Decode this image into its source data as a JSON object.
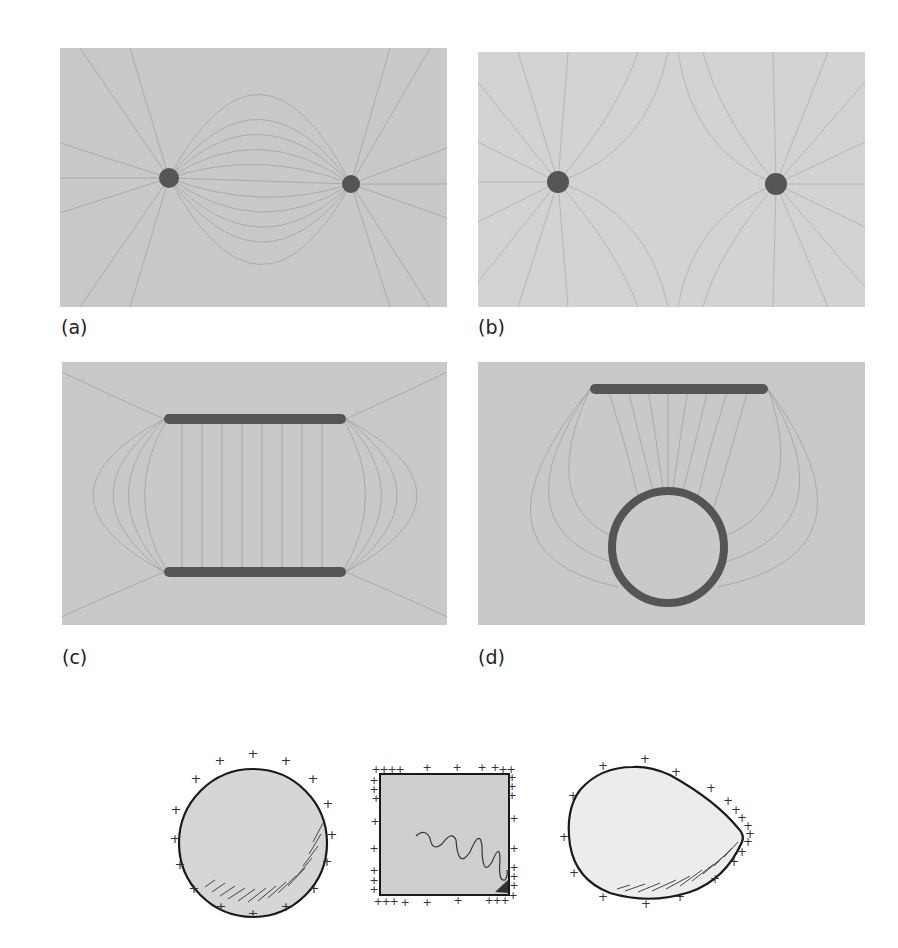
{
  "figure": {
    "panels": [
      {
        "id": "a",
        "label": "(a)",
        "description": "Field lines of two equal and opposite point charges (electric dipole)",
        "objects": [
          {
            "type": "point-charge",
            "cx": 109,
            "cy": 130
          },
          {
            "type": "point-charge",
            "cx": 291,
            "cy": 136
          }
        ]
      },
      {
        "id": "b",
        "label": "(b)",
        "description": "Field lines of two equal like point charges",
        "objects": [
          {
            "type": "point-charge",
            "cx": 80,
            "cy": 130
          },
          {
            "type": "point-charge",
            "cx": 298,
            "cy": 132
          }
        ]
      },
      {
        "id": "c",
        "label": "(c)",
        "description": "Field lines between two oppositely charged parallel plates",
        "objects": [
          {
            "type": "plate",
            "x1": 102,
            "x2": 284,
            "y": 57
          },
          {
            "type": "plate",
            "x1": 102,
            "x2": 284,
            "y": 210
          }
        ]
      },
      {
        "id": "d",
        "label": "(d)",
        "description": "Field lines between a charged plate and a charged ring",
        "objects": [
          {
            "type": "plate",
            "x1": 112,
            "x2": 290,
            "y": 27
          },
          {
            "type": "ring",
            "cx": 190,
            "cy": 185,
            "r": 58
          }
        ]
      }
    ],
    "conductors": [
      {
        "shape": "circle",
        "description": "Spherical conductor with uniform surface charge"
      },
      {
        "shape": "square",
        "description": "Square conductor with charge concentrated at corners"
      },
      {
        "shape": "teardrop",
        "description": "Pointed conductor with charge concentrated at the tip"
      }
    ],
    "charge_symbol": "+",
    "colors": {
      "panel_background": "#c9c9c9",
      "field_line": "#8c8c8c",
      "charge": "#555555",
      "conductor_fill": "#d6d6d6",
      "outline": "#1a1a1a"
    }
  }
}
